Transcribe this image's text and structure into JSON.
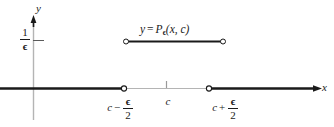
{
  "figure": {
    "type": "math-graph",
    "axes": {
      "y_label": "y",
      "x_label": "x",
      "y_tick_label": {
        "numerator": "1",
        "denominator": "ϵ"
      }
    },
    "curve_label": {
      "lhs": "y",
      "equals": "=",
      "function_name": "P",
      "subscript": "ϵ",
      "arguments": "(x, c)"
    },
    "x_ticks": [
      {
        "name": "left-endpoint",
        "base": "c",
        "operator": "−",
        "numerator": "ϵ",
        "denominator": "2"
      },
      {
        "name": "center",
        "base": "c",
        "operator": "",
        "numerator": "",
        "denominator": ""
      },
      {
        "name": "right-endpoint",
        "base": "c",
        "operator": "+",
        "numerator": "ϵ",
        "denominator": "2"
      }
    ],
    "colors": {
      "curve": "#1a1a1a",
      "axis_strong": "#1a1a1a",
      "axis_light": "#b4b4b4",
      "background": "#ffffff"
    }
  }
}
